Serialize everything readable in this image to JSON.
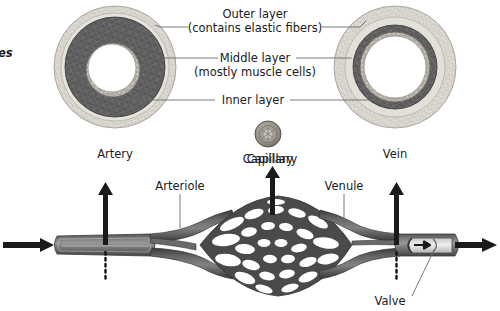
{
  "figure": {
    "edge_clipped_text": "es"
  },
  "cross_sections": {
    "layer_labels": [
      {
        "id": "outer",
        "line1": "Outer layer",
        "line2": "(contains elastic fibers)"
      },
      {
        "id": "middle",
        "line1": "Middle layer",
        "line2": "(mostly muscle cells)"
      },
      {
        "id": "inner",
        "line1": "Inner layer",
        "line2": ""
      }
    ],
    "vessels": [
      {
        "id": "artery",
        "label": "Artery"
      },
      {
        "id": "capillary",
        "label": "Capillary"
      },
      {
        "id": "vein",
        "label": "Vein"
      }
    ]
  },
  "network": {
    "labels": [
      {
        "id": "arteriole",
        "label": "Arteriole"
      },
      {
        "id": "capillary-bed",
        "label": "Capillary"
      },
      {
        "id": "venule",
        "label": "Venule"
      },
      {
        "id": "valve",
        "label": "Valve"
      }
    ]
  },
  "colors": {
    "outer_layer": "#d8d5cf",
    "middle_layer": "#5f5f5f",
    "inner_layer": "#a8a59f",
    "lumen": "#ffffff",
    "vessel_body": "#6e6e6e",
    "vessel_dark": "#3d3d3d",
    "arrow": "#1a1a1a",
    "leader": "#6b6b6b",
    "text": "#1a1a1a",
    "background": "#ffffff"
  }
}
